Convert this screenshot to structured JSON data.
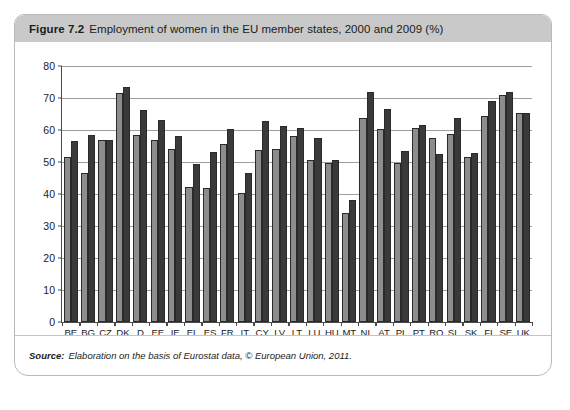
{
  "figure": {
    "number": "Figure 7.2",
    "title": "Employment of women in the EU member states, 2000 and 2009 (%)",
    "source_label": "Source:",
    "source_text": "Elaboration on the basis of Eurostat data, © European Union, 2011."
  },
  "colors": {
    "series_2000": "#8d8d8d",
    "series_2009": "#3a3a3a",
    "header_bg": "#c9c9c9",
    "frame_border": "#b9b9b9",
    "axis": "#4a4a4a",
    "gridline": "#9e9e9e"
  },
  "chart_data": {
    "type": "bar",
    "title": "Employment of women in the EU member states, 2000 and 2009 (%)",
    "xlabel": "",
    "ylabel": "",
    "ylim": [
      0,
      80
    ],
    "yticks": [
      0,
      10,
      20,
      30,
      40,
      50,
      60,
      70,
      80
    ],
    "grid": true,
    "legend": false,
    "legend_position": "none",
    "categories": [
      "BE",
      "BG",
      "CZ",
      "DK",
      "D",
      "EE",
      "IE",
      "EL",
      "ES",
      "FR",
      "IT",
      "CY",
      "LV",
      "LT",
      "LU",
      "HU",
      "MT",
      "NL",
      "AT",
      "PL",
      "PT",
      "RO",
      "SL",
      "SK",
      "FI",
      "SE",
      "UK"
    ],
    "series": [
      {
        "name": "2000",
        "values": [
          51.5,
          46.5,
          57.0,
          71.5,
          58.3,
          57.0,
          54.2,
          42.2,
          41.8,
          55.7,
          40.2,
          53.9,
          54.2,
          58.0,
          50.6,
          49.8,
          34.2,
          63.9,
          60.2,
          49.8,
          60.5,
          57.5,
          58.8,
          51.5,
          64.5,
          70.9,
          65.3
        ]
      },
      {
        "name": "2009",
        "values": [
          56.5,
          58.3,
          57.0,
          73.5,
          66.3,
          63.2,
          58.0,
          49.5,
          53.2,
          60.2,
          46.6,
          62.8,
          61.3,
          60.7,
          57.5,
          50.5,
          38.2,
          71.8,
          66.5,
          53.5,
          61.6,
          52.5,
          63.8,
          52.8,
          69.0,
          71.8,
          65.3
        ]
      }
    ]
  }
}
